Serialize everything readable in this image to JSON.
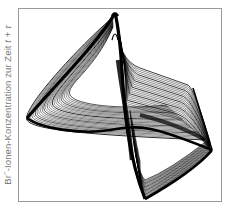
{
  "chart_data": {
    "type": "scatter",
    "title": "",
    "subtitle": "",
    "plot_kind": "phase-space reconstruction (strange attractor, Belousov-Zhabotinsky reaction)",
    "xlabel": "",
    "ylabel": {
      "prefix": "Br",
      "superscript": "−",
      "main": "-Ionen-Konzentration zur Zeit ",
      "var_t": "t",
      "plus": " + ",
      "var_tau": "τ"
    },
    "ylabel_full": "Br⁻-Ionen-Konzentration zur Zeit t + τ",
    "x_ticks": [],
    "y_ticks": [],
    "grid": false,
    "legend": null,
    "attractor_landmarks_px": {
      "top_peak": [
        115,
        13
      ],
      "left_tip": [
        27,
        118
      ],
      "upper_right_corner": [
        193,
        88
      ],
      "right_tip": [
        212,
        150
      ],
      "bottom_tip": [
        145,
        199
      ]
    },
    "colors": {
      "trajectory": "#000000",
      "frame": "#9a9a9a",
      "label": "#7a7a7a",
      "background": "#ffffff"
    }
  }
}
